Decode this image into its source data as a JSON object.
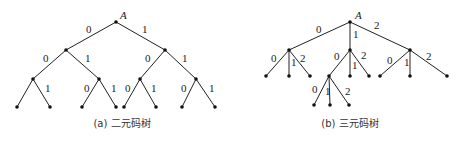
{
  "binary_tree": {
    "root_label": "A",
    "caption": "(a) 二元码树",
    "edges": [
      {
        "x1": 116,
        "y1": 22,
        "x2": 66,
        "y2": 50,
        "label": "0",
        "lx": 86,
        "ly": 33
      },
      {
        "x1": 116,
        "y1": 22,
        "x2": 165,
        "y2": 50,
        "label": "1",
        "lx": 142,
        "ly": 33
      },
      {
        "x1": 66,
        "y1": 50,
        "x2": 33,
        "y2": 79,
        "label": "0",
        "lx": 43,
        "ly": 62
      },
      {
        "x1": 66,
        "y1": 50,
        "x2": 99,
        "y2": 79,
        "label": "1",
        "lx": 85,
        "ly": 62
      },
      {
        "x1": 165,
        "y1": 50,
        "x2": 140,
        "y2": 79,
        "label": "0",
        "lx": 145,
        "ly": 62
      },
      {
        "x1": 165,
        "y1": 50,
        "x2": 196,
        "y2": 79,
        "label": "1",
        "lx": 182,
        "ly": 62
      },
      {
        "x1": 33,
        "y1": 79,
        "x2": 17,
        "y2": 107,
        "label": "",
        "lx": 0,
        "ly": 0
      },
      {
        "x1": 33,
        "y1": 79,
        "x2": 50,
        "y2": 107,
        "label": "1",
        "lx": 45,
        "ly": 92
      },
      {
        "x1": 99,
        "y1": 79,
        "x2": 82,
        "y2": 107,
        "label": "0",
        "lx": 84,
        "ly": 92
      },
      {
        "x1": 99,
        "y1": 79,
        "x2": 116,
        "y2": 107,
        "label": "1",
        "lx": 111,
        "ly": 92
      },
      {
        "x1": 140,
        "y1": 79,
        "x2": 124,
        "y2": 107,
        "label": "0",
        "lx": 125,
        "ly": 92
      },
      {
        "x1": 140,
        "y1": 79,
        "x2": 156,
        "y2": 107,
        "label": "1",
        "lx": 151,
        "ly": 92
      },
      {
        "x1": 196,
        "y1": 79,
        "x2": 182,
        "y2": 107,
        "label": "0",
        "lx": 181,
        "ly": 92
      },
      {
        "x1": 196,
        "y1": 79,
        "x2": 215,
        "y2": 107,
        "label": "1",
        "lx": 209,
        "ly": 92
      }
    ],
    "nodes": [
      [
        116,
        22
      ],
      [
        66,
        50
      ],
      [
        165,
        50
      ],
      [
        33,
        79
      ],
      [
        99,
        79
      ],
      [
        140,
        79
      ],
      [
        196,
        79
      ],
      [
        17,
        107
      ],
      [
        50,
        107
      ],
      [
        82,
        107
      ],
      [
        116,
        107
      ],
      [
        124,
        107
      ],
      [
        156,
        107
      ],
      [
        182,
        107
      ],
      [
        215,
        107
      ]
    ]
  },
  "ternary_tree": {
    "root_label": "A",
    "caption": "(b) 三元码树",
    "edges": [
      {
        "x1": 350,
        "y1": 22,
        "x2": 289,
        "y2": 50,
        "label": "0",
        "lx": 316,
        "ly": 33
      },
      {
        "x1": 350,
        "y1": 22,
        "x2": 350,
        "y2": 50,
        "label": "1",
        "lx": 353,
        "ly": 38
      },
      {
        "x1": 350,
        "y1": 22,
        "x2": 410,
        "y2": 50,
        "label": "2",
        "lx": 374,
        "ly": 29
      },
      {
        "x1": 289,
        "y1": 50,
        "x2": 266,
        "y2": 76,
        "label": "0",
        "lx": 271,
        "ly": 62
      },
      {
        "x1": 289,
        "y1": 50,
        "x2": 289,
        "y2": 76,
        "label": "1",
        "lx": 291,
        "ly": 66
      },
      {
        "x1": 289,
        "y1": 50,
        "x2": 310,
        "y2": 76,
        "label": "2",
        "lx": 300,
        "ly": 62
      },
      {
        "x1": 350,
        "y1": 50,
        "x2": 329,
        "y2": 76,
        "label": "0",
        "lx": 334,
        "ly": 60
      },
      {
        "x1": 350,
        "y1": 50,
        "x2": 350,
        "y2": 76,
        "label": "1",
        "lx": 352,
        "ly": 69
      },
      {
        "x1": 350,
        "y1": 50,
        "x2": 369,
        "y2": 76,
        "label": "2",
        "lx": 361,
        "ly": 59
      },
      {
        "x1": 410,
        "y1": 50,
        "x2": 380,
        "y2": 76,
        "label": "0",
        "lx": 387,
        "ly": 64
      },
      {
        "x1": 410,
        "y1": 50,
        "x2": 410,
        "y2": 76,
        "label": "1",
        "lx": 404,
        "ly": 66
      },
      {
        "x1": 410,
        "y1": 50,
        "x2": 447,
        "y2": 76,
        "label": "2",
        "lx": 426,
        "ly": 60
      },
      {
        "x1": 329,
        "y1": 76,
        "x2": 314,
        "y2": 105,
        "label": "0",
        "lx": 312,
        "ly": 93
      },
      {
        "x1": 329,
        "y1": 76,
        "x2": 330,
        "y2": 105,
        "label": "1",
        "lx": 325,
        "ly": 95
      },
      {
        "x1": 329,
        "y1": 76,
        "x2": 349,
        "y2": 105,
        "label": "2",
        "lx": 345,
        "ly": 95
      }
    ],
    "nodes": [
      [
        350,
        22
      ],
      [
        289,
        50
      ],
      [
        350,
        50
      ],
      [
        410,
        50
      ],
      [
        266,
        76
      ],
      [
        289,
        76
      ],
      [
        310,
        76
      ],
      [
        329,
        76
      ],
      [
        350,
        76
      ],
      [
        369,
        76
      ],
      [
        380,
        76
      ],
      [
        410,
        76
      ],
      [
        447,
        76
      ],
      [
        314,
        105
      ],
      [
        330,
        105
      ],
      [
        349,
        105
      ]
    ]
  }
}
